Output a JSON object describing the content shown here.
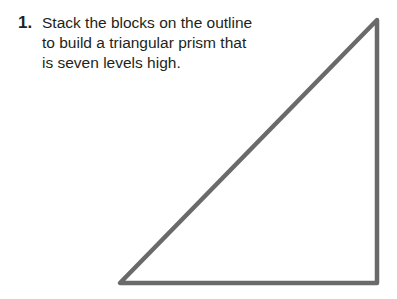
{
  "problem": {
    "number": "1.",
    "lines": [
      "Stack the blocks on the outline",
      "to build a triangular prism that",
      "is seven levels high."
    ]
  },
  "figure": {
    "shape": "right triangle outline",
    "stroke_color": "#6a6a6a",
    "vertices": [
      [
        377,
        20
      ],
      [
        120,
        283
      ],
      [
        377,
        283
      ]
    ]
  }
}
